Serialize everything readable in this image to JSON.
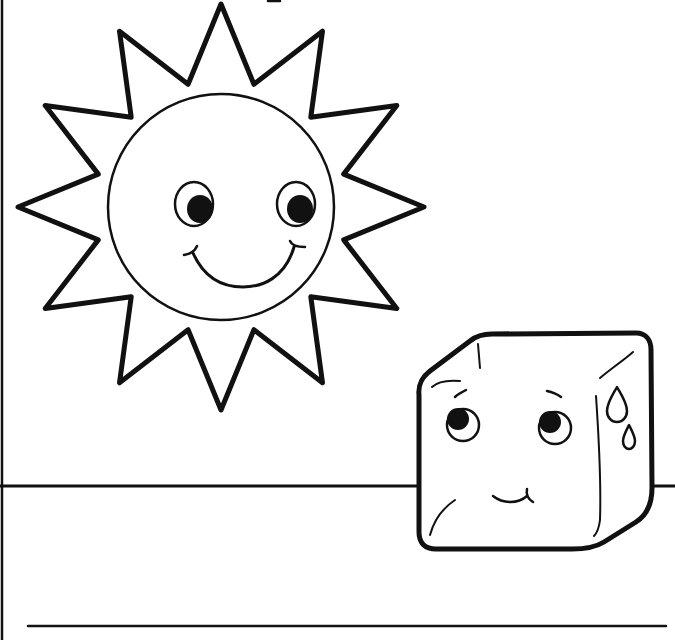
{
  "page": {
    "type": "coloring-page",
    "description": "Black and white line drawing of a smiling sun and a worried melting ice cube above a writing line",
    "background_color": "#ffffff",
    "ink_color": "#111111"
  },
  "illustration": {
    "sun": {
      "label": "sun",
      "center": [
        221,
        207
      ],
      "ray_count": 12,
      "ray_tip_radius": 203,
      "ray_inner_radius": 127,
      "face_radius": 113,
      "expression": "smiling"
    },
    "ice_cube": {
      "label": "ice cube",
      "expression": "worried",
      "sweat_drops": 2
    },
    "ground_line_y": 486,
    "writing_line": {
      "y": 626,
      "x_start": 28,
      "x_end": 666
    }
  }
}
